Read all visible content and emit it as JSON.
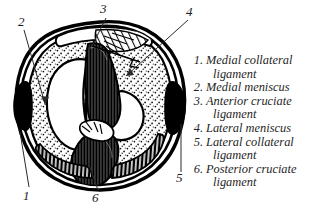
{
  "illustration": {
    "name": "knee-tibial-plateau-superior-view",
    "description": "Black and white line drawing, superior view of the tibial plateau showing menisci, cruciate and collateral ligaments",
    "colors": {
      "ink": "#000000",
      "background": "#ffffff",
      "stipple": "#111111"
    },
    "callouts": [
      {
        "number": "1",
        "target": "medial collateral ligament"
      },
      {
        "number": "2",
        "target": "medial meniscus"
      },
      {
        "number": "3",
        "target": "anterior cruciate ligament"
      },
      {
        "number": "4",
        "target": "lateral meniscus"
      },
      {
        "number": "5",
        "target": "lateral collateral ligament"
      },
      {
        "number": "6",
        "target": "posterior cruciate ligament"
      }
    ]
  },
  "legend": {
    "items": [
      {
        "number": "1.",
        "line1": "Medial collateral",
        "line2": "ligament"
      },
      {
        "number": "2.",
        "line1": "Medial meniscus",
        "line2": ""
      },
      {
        "number": "3.",
        "line1": "Anterior cruciate",
        "line2": "ligament"
      },
      {
        "number": "4.",
        "line1": "Lateral meniscus",
        "line2": ""
      },
      {
        "number": "5.",
        "line1": "Lateral collateral",
        "line2": "ligament"
      },
      {
        "number": "6.",
        "line1": "Posterior cruciate",
        "line2": "ligament"
      }
    ]
  }
}
